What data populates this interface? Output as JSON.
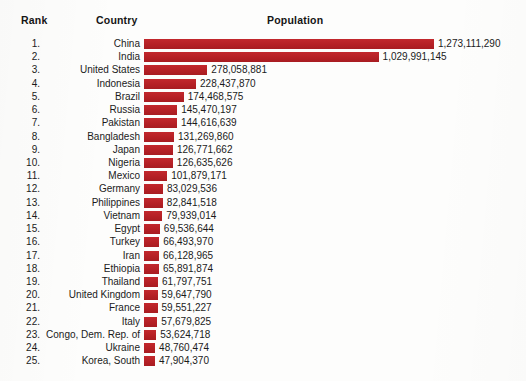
{
  "header": {
    "rank_label": "Rank",
    "country_label": "Country",
    "population_label": "Population"
  },
  "chart_data": {
    "type": "bar",
    "title": "Population",
    "xlabel": "Population",
    "ylabel": "Country",
    "orientation": "horizontal",
    "grid": false,
    "legend": null,
    "xlim": [
      0,
      1273111290
    ],
    "bar_color": "#b52025",
    "columns": [
      "Rank",
      "Country",
      "Population"
    ],
    "categories": [
      "China",
      "India",
      "United States",
      "Indonesia",
      "Brazil",
      "Russia",
      "Pakistan",
      "Bangladesh",
      "Japan",
      "Nigeria",
      "Mexico",
      "Germany",
      "Philippines",
      "Vietnam",
      "Egypt",
      "Turkey",
      "Iran",
      "Ethiopia",
      "Thailand",
      "United Kingdom",
      "France",
      "Italy",
      "Congo, Dem. Rep. of",
      "Ukraine",
      "Korea, South"
    ],
    "values": [
      1273111290,
      1029991145,
      278058881,
      228437870,
      174468575,
      145470197,
      144616639,
      131269860,
      126771662,
      126635626,
      101879171,
      83029536,
      82841518,
      79939014,
      69536644,
      66493970,
      66128965,
      65891874,
      61797751,
      59647790,
      59551227,
      57679825,
      53624718,
      48760474,
      47904370
    ],
    "rows": [
      {
        "rank": "1.",
        "country": "China",
        "value": 1273111290,
        "value_label": "1,273,111,290"
      },
      {
        "rank": "2.",
        "country": "India",
        "value": 1029991145,
        "value_label": "1,029,991,145"
      },
      {
        "rank": "3.",
        "country": "United States",
        "value": 278058881,
        "value_label": "278,058,881"
      },
      {
        "rank": "4.",
        "country": "Indonesia",
        "value": 228437870,
        "value_label": "228,437,870"
      },
      {
        "rank": "5.",
        "country": "Brazil",
        "value": 174468575,
        "value_label": "174,468,575"
      },
      {
        "rank": "6.",
        "country": "Russia",
        "value": 145470197,
        "value_label": "145,470,197"
      },
      {
        "rank": "7.",
        "country": "Pakistan",
        "value": 144616639,
        "value_label": "144,616,639"
      },
      {
        "rank": "8.",
        "country": "Bangladesh",
        "value": 131269860,
        "value_label": "131,269,860"
      },
      {
        "rank": "9.",
        "country": "Japan",
        "value": 126771662,
        "value_label": "126,771,662"
      },
      {
        "rank": "10.",
        "country": "Nigeria",
        "value": 126635626,
        "value_label": "126,635,626"
      },
      {
        "rank": "11.",
        "country": "Mexico",
        "value": 101879171,
        "value_label": "101,879,171"
      },
      {
        "rank": "12.",
        "country": "Germany",
        "value": 83029536,
        "value_label": "83,029,536"
      },
      {
        "rank": "13.",
        "country": "Philippines",
        "value": 82841518,
        "value_label": "82,841,518"
      },
      {
        "rank": "14.",
        "country": "Vietnam",
        "value": 79939014,
        "value_label": "79,939,014"
      },
      {
        "rank": "15.",
        "country": "Egypt",
        "value": 69536644,
        "value_label": "69,536,644"
      },
      {
        "rank": "16.",
        "country": "Turkey",
        "value": 66493970,
        "value_label": "66,493,970"
      },
      {
        "rank": "17.",
        "country": "Iran",
        "value": 66128965,
        "value_label": "66,128,965"
      },
      {
        "rank": "18.",
        "country": "Ethiopia",
        "value": 65891874,
        "value_label": "65,891,874"
      },
      {
        "rank": "19.",
        "country": "Thailand",
        "value": 61797751,
        "value_label": "61,797,751"
      },
      {
        "rank": "20.",
        "country": "United Kingdom",
        "value": 59647790,
        "value_label": "59,647,790"
      },
      {
        "rank": "21.",
        "country": "France",
        "value": 59551227,
        "value_label": "59,551,227"
      },
      {
        "rank": "22.",
        "country": "Italy",
        "value": 57679825,
        "value_label": "57,679,825"
      },
      {
        "rank": "23.",
        "country": "Congo, Dem. Rep. of",
        "value": 53624718,
        "value_label": "53,624,718"
      },
      {
        "rank": "24.",
        "country": "Ukraine",
        "value": 48760474,
        "value_label": "48,760,474"
      },
      {
        "rank": "25.",
        "country": "Korea, South",
        "value": 47904370,
        "value_label": "47,904,370"
      }
    ]
  }
}
